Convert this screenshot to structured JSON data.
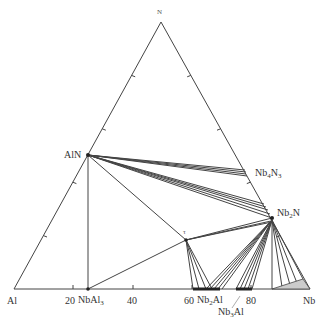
{
  "diagram": {
    "type": "ternary-phase-diagram",
    "vertices": {
      "top": "N",
      "left": "Al",
      "right": "Nb"
    },
    "axis_ticks": [
      "20",
      "40",
      "60",
      "80"
    ],
    "phases": {
      "aln": "AlN",
      "nb4n3_base": "Nb",
      "nb4n3_s1": "4",
      "nb4n3_mid": "N",
      "nb4n3_s2": "3",
      "nb2n_base": "Nb",
      "nb2n_s1": "2",
      "nb2n_mid": "N",
      "tau": "τ",
      "nbal3_base": "NbAl",
      "nbal3_s": "3",
      "nb2al_base": "Nb",
      "nb2al_s": "2",
      "nb2al_mid": "Al",
      "nb3al_base": "Nb",
      "nb3al_s": "3",
      "nb3al_mid": "Al"
    },
    "colors": {
      "line": "#444444",
      "shade": "#cccccc"
    }
  }
}
